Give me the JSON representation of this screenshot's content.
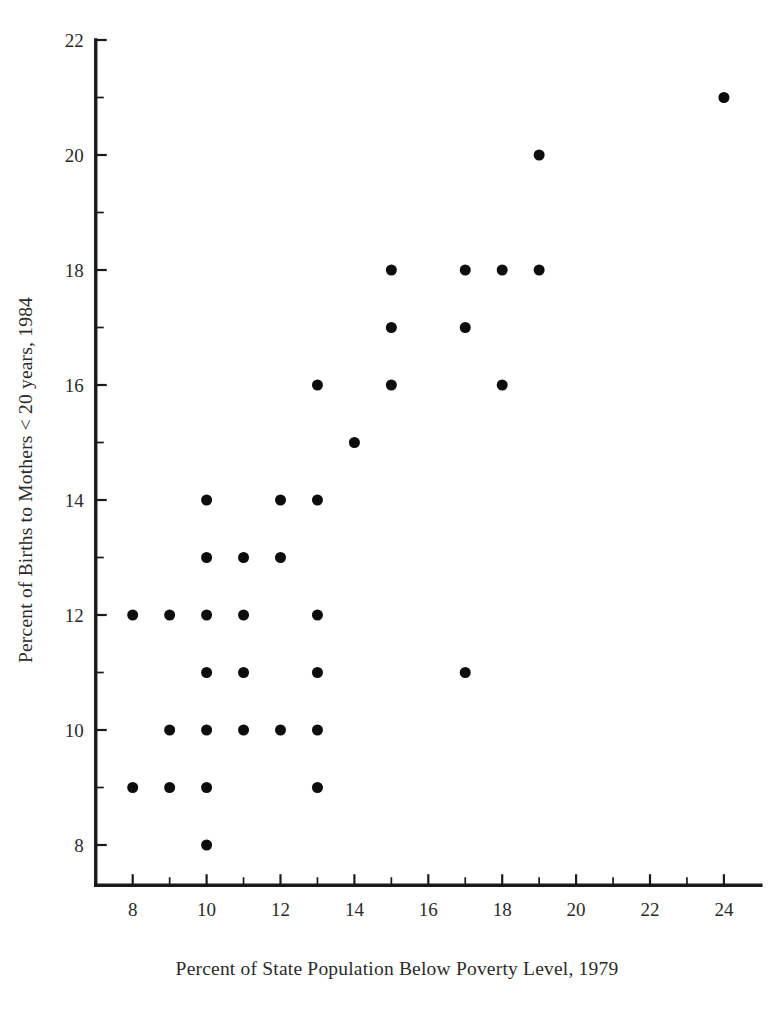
{
  "chart_data": {
    "type": "scatter",
    "title": "",
    "xlabel": "Percent of State Population Below Poverty Level, 1979",
    "ylabel": "Percent of Births to Mothers < 20 years, 1984",
    "xlim": [
      7,
      25
    ],
    "ylim": [
      7.3,
      22
    ],
    "grid": false,
    "legend": null,
    "x_ticks_major": [
      8,
      10,
      12,
      14,
      16,
      18,
      20,
      22,
      24
    ],
    "x_ticks_minor": [
      9,
      11,
      13,
      15,
      17,
      19,
      21,
      23
    ],
    "y_ticks_major": [
      8,
      10,
      12,
      14,
      16,
      18,
      20,
      22
    ],
    "y_ticks_minor": [
      9,
      11,
      13,
      15,
      17,
      19,
      21
    ],
    "marker": "filled-circle",
    "marker_color": "#0d0d0d",
    "marker_size_px": 11,
    "n_points": 36,
    "points": [
      {
        "x": 8,
        "y": 12
      },
      {
        "x": 9,
        "y": 12
      },
      {
        "x": 10,
        "y": 12
      },
      {
        "x": 11,
        "y": 12
      },
      {
        "x": 13,
        "y": 12
      },
      {
        "x": 8,
        "y": 9
      },
      {
        "x": 9,
        "y": 9
      },
      {
        "x": 10,
        "y": 9
      },
      {
        "x": 13,
        "y": 9
      },
      {
        "x": 10,
        "y": 8
      },
      {
        "x": 9,
        "y": 10
      },
      {
        "x": 10,
        "y": 10
      },
      {
        "x": 11,
        "y": 10
      },
      {
        "x": 12,
        "y": 10
      },
      {
        "x": 13,
        "y": 10
      },
      {
        "x": 10,
        "y": 11
      },
      {
        "x": 11,
        "y": 11
      },
      {
        "x": 13,
        "y": 11
      },
      {
        "x": 17,
        "y": 11
      },
      {
        "x": 10,
        "y": 13
      },
      {
        "x": 11,
        "y": 13
      },
      {
        "x": 12,
        "y": 13
      },
      {
        "x": 10,
        "y": 14
      },
      {
        "x": 12,
        "y": 14
      },
      {
        "x": 13,
        "y": 14
      },
      {
        "x": 14,
        "y": 15
      },
      {
        "x": 13,
        "y": 16
      },
      {
        "x": 15,
        "y": 16
      },
      {
        "x": 18,
        "y": 16
      },
      {
        "x": 15,
        "y": 17
      },
      {
        "x": 17,
        "y": 17
      },
      {
        "x": 15,
        "y": 18
      },
      {
        "x": 17,
        "y": 18
      },
      {
        "x": 18,
        "y": 18
      },
      {
        "x": 19,
        "y": 18
      },
      {
        "x": 19,
        "y": 20
      },
      {
        "x": 24,
        "y": 21
      }
    ]
  },
  "labels": {
    "x_axis_title": "Percent of State Population Below Poverty Level, 1979",
    "y_axis_title": "Percent of Births to Mothers < 20 years, 1984",
    "x_tick_labels": [
      "8",
      "10",
      "12",
      "14",
      "16",
      "18",
      "20",
      "22",
      "24"
    ],
    "y_tick_labels": [
      "8",
      "10",
      "12",
      "14",
      "16",
      "18",
      "20",
      "22"
    ]
  },
  "colors": {
    "marker": "#0d0d0d",
    "axis": "#1a1a1a",
    "text": "#2b2b2b",
    "background": "#ffffff"
  }
}
